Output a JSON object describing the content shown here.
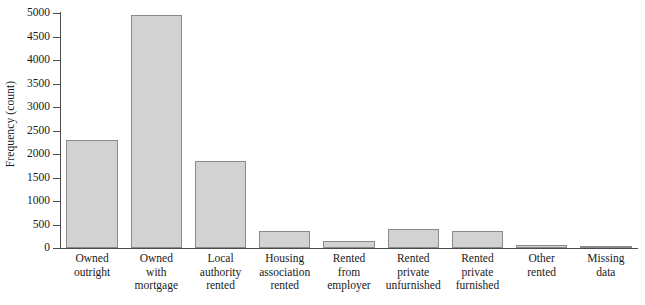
{
  "chart_data": {
    "type": "bar",
    "title": "",
    "xlabel": "",
    "ylabel": "Frequency (count)",
    "categories": [
      "Owned outright",
      "Owned with mortgage",
      "Local authority rented",
      "Housing association rented",
      "Rented from employer",
      "Rented private unfurnished",
      "Rented private furnished",
      "Other rented",
      "Missing data"
    ],
    "category_lines": [
      [
        "Owned",
        "outright"
      ],
      [
        "Owned",
        "with",
        "mortgage"
      ],
      [
        "Local",
        "authority",
        "rented"
      ],
      [
        "Housing",
        "association",
        "rented"
      ],
      [
        "Rented",
        "from",
        "employer"
      ],
      [
        "Rented",
        "private",
        "unfurnished"
      ],
      [
        "Rented",
        "private",
        "furnished"
      ],
      [
        "Other",
        "rented"
      ],
      [
        "Missing",
        "data"
      ]
    ],
    "values": [
      2300,
      4950,
      1850,
      370,
      150,
      400,
      370,
      60,
      40
    ],
    "ylim": [
      0,
      5000
    ],
    "yticks": [
      0,
      500,
      1000,
      1500,
      2000,
      2500,
      3000,
      3500,
      4000,
      4500,
      5000
    ],
    "ytick_labels": [
      "0",
      "500",
      "1000",
      "1500",
      "2000",
      "2500",
      "3000",
      "3500",
      "4000",
      "4500",
      "5000"
    ],
    "grid": false,
    "legend": null,
    "bar_color": "#d2d2d2",
    "bar_edge_color": "#8a8a8a",
    "axis_color": "#4a4a4a",
    "background_color": "#ffffff"
  }
}
